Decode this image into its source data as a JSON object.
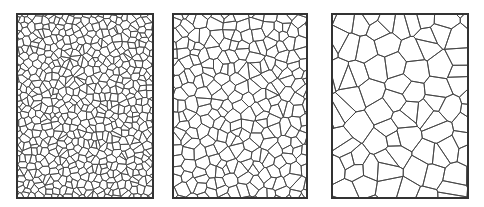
{
  "figure": {
    "stroke_color": "#444444",
    "border_color": "#333333",
    "background": "#ffffff",
    "panels": [
      {
        "id": "fine",
        "label": "",
        "x": 16,
        "width": 138,
        "cell": 7,
        "seed": 11,
        "stroke": 0.8
      },
      {
        "id": "medium",
        "label": "",
        "x": 172,
        "width": 136,
        "cell": 11,
        "seed": 23,
        "stroke": 0.85
      },
      {
        "id": "coarse",
        "label": "",
        "x": 331,
        "width": 138,
        "cell": 20,
        "seed": 37,
        "stroke": 0.9
      }
    ]
  }
}
